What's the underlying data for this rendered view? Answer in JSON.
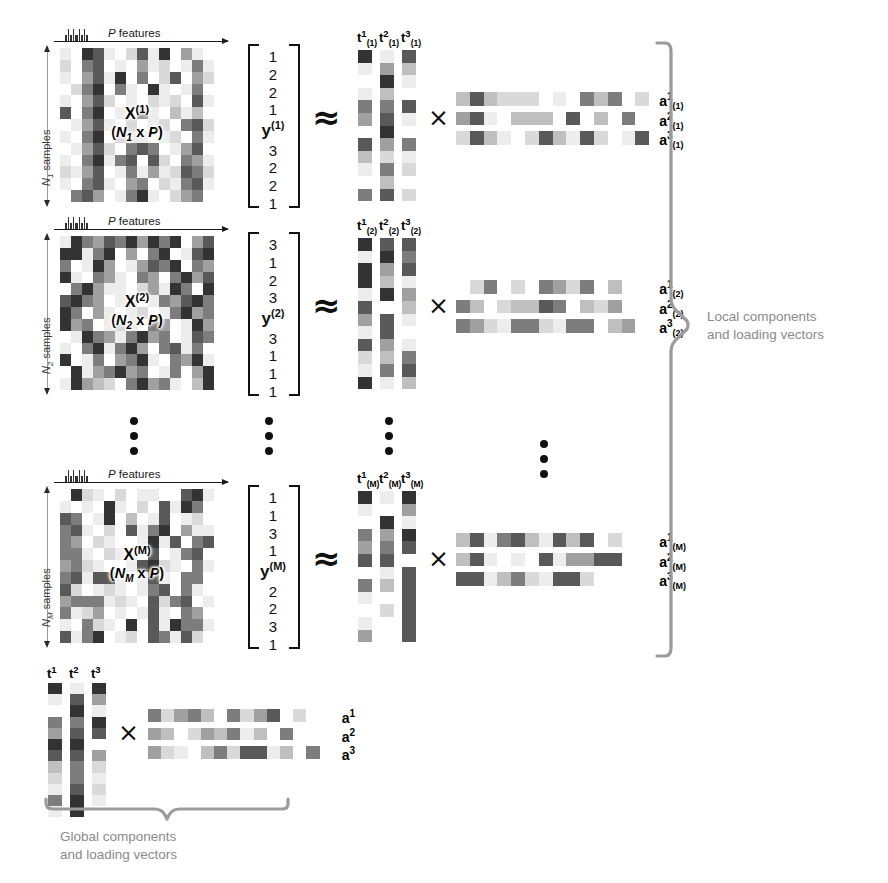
{
  "figure": {
    "palette": {
      "c0": "#ffffff",
      "c1": "#ededed",
      "c2": "#d9d9d9",
      "c3": "#bfbfbf",
      "c4": "#a0a0a0",
      "c5": "#7d7d7d",
      "c6": "#595959",
      "c7": "#333333",
      "brace": "#9b9b9b",
      "brace_text": "#8a8a8a",
      "ink": "#111111"
    },
    "symbols": {
      "approx": "≈",
      "times": "×",
      "ellipsis_dot_count": 3
    }
  },
  "blocks": [
    {
      "id": "block-1",
      "x_label_main": "X",
      "x_label_sup": "(1)",
      "x_dim_open": "(",
      "x_dim_n": "N",
      "x_dim_n_sub": "1",
      "x_dim_mid": " x ",
      "x_dim_p": "P",
      "x_dim_close": ")",
      "features_label": "P features",
      "samples_label_n": "N",
      "samples_label_sub": "1",
      "samples_label_rest": " samples",
      "y_label": "y",
      "y_label_sup": "(1)",
      "y_values_top": [
        "1",
        "2",
        "2",
        "1"
      ],
      "y_values_bottom": [
        "3",
        "2",
        "2",
        "1"
      ],
      "t_labels": [
        {
          "base": "t",
          "sup": "1",
          "sub": "(1)"
        },
        {
          "base": "t",
          "sup": "2",
          "sub": "(1)"
        },
        {
          "base": "t",
          "sup": "3",
          "sub": "(1)"
        }
      ],
      "a_labels": [
        {
          "base": "a",
          "sup": "1",
          "sub": "(1)"
        },
        {
          "base": "a",
          "sup": "2",
          "sub": "(1)"
        },
        {
          "base": "a",
          "sup": "3",
          "sub": "(1)"
        }
      ],
      "x_matrix": [
        [
          1,
          0,
          7,
          6,
          1,
          0,
          2,
          6,
          1,
          7,
          0,
          4,
          1,
          0
        ],
        [
          2,
          0,
          5,
          6,
          0,
          1,
          0,
          4,
          1,
          2,
          0,
          1,
          5,
          1
        ],
        [
          1,
          0,
          4,
          6,
          1,
          7,
          0,
          5,
          0,
          2,
          6,
          0,
          4,
          2
        ],
        [
          0,
          2,
          5,
          7,
          0,
          5,
          1,
          0,
          7,
          1,
          0,
          1,
          5,
          0
        ],
        [
          1,
          0,
          4,
          6,
          2,
          0,
          1,
          0,
          2,
          1,
          2,
          0,
          6,
          1
        ],
        [
          6,
          0,
          5,
          7,
          0,
          1,
          0,
          4,
          1,
          0,
          3,
          1,
          3,
          0
        ],
        [
          0,
          1,
          4,
          6,
          1,
          0,
          2,
          0,
          1,
          2,
          0,
          5,
          6,
          2
        ],
        [
          1,
          0,
          5,
          7,
          0,
          2,
          1,
          1,
          0,
          1,
          2,
          0,
          5,
          1
        ],
        [
          0,
          1,
          4,
          6,
          2,
          0,
          5,
          6,
          5,
          0,
          1,
          4,
          6,
          0
        ],
        [
          1,
          0,
          5,
          7,
          1,
          5,
          6,
          0,
          6,
          2,
          0,
          5,
          4,
          1
        ],
        [
          2,
          1,
          4,
          6,
          0,
          1,
          5,
          1,
          4,
          1,
          2,
          6,
          5,
          2
        ],
        [
          1,
          0,
          5,
          6,
          1,
          0,
          4,
          5,
          0,
          2,
          1,
          5,
          6,
          1
        ],
        [
          0,
          5,
          6,
          4,
          0,
          1,
          5,
          7,
          1,
          0,
          2,
          4,
          5,
          0
        ]
      ],
      "t_matrix": [
        [
          7,
          1,
          6
        ],
        [
          1,
          4,
          3
        ],
        [
          0,
          7,
          1
        ],
        [
          1,
          3,
          0
        ],
        [
          5,
          5,
          6
        ],
        [
          4,
          6,
          1
        ],
        [
          0,
          7,
          0
        ],
        [
          6,
          4,
          5
        ],
        [
          3,
          2,
          1
        ],
        [
          1,
          5,
          2
        ],
        [
          0,
          3,
          0
        ],
        [
          5,
          6,
          2
        ]
      ],
      "a_matrix": [
        [
          3,
          6,
          3,
          2,
          2,
          2,
          0,
          1,
          0,
          5,
          3,
          5,
          0,
          2
        ],
        [
          4,
          6,
          1,
          0,
          3,
          3,
          3,
          0,
          6,
          0,
          3,
          0,
          5,
          0
        ],
        [
          2,
          6,
          3,
          1,
          0,
          2,
          6,
          3,
          1,
          6,
          2,
          0,
          1,
          6
        ]
      ]
    },
    {
      "id": "block-2",
      "x_label_main": "X",
      "x_label_sup": "(2)",
      "x_dim_open": "(",
      "x_dim_n": "N",
      "x_dim_n_sub": "2",
      "x_dim_mid": " x ",
      "x_dim_p": "P",
      "x_dim_close": ")",
      "features_label": "P features",
      "samples_label_n": "N",
      "samples_label_sub": "2",
      "samples_label_rest": " samples",
      "y_label": "y",
      "y_label_sup": "(2)",
      "y_values_top": [
        "3",
        "1",
        "2",
        "3"
      ],
      "y_values_bottom": [
        "3",
        "1",
        "1",
        "1"
      ],
      "t_labels": [
        {
          "base": "t",
          "sup": "1",
          "sub": "(2)"
        },
        {
          "base": "t",
          "sup": "2",
          "sub": "(2)"
        },
        {
          "base": "t",
          "sup": "3",
          "sub": "(2)"
        }
      ],
      "a_labels": [
        {
          "base": "a",
          "sup": "1",
          "sub": "(2)"
        },
        {
          "base": "a",
          "sup": "2",
          "sub": "(2)"
        },
        {
          "base": "a",
          "sup": "3",
          "sub": "(2)"
        }
      ],
      "x_matrix": [
        [
          1,
          7,
          5,
          4,
          6,
          5,
          7,
          4,
          7,
          5,
          7,
          0,
          4,
          6
        ],
        [
          7,
          7,
          1,
          5,
          7,
          0,
          4,
          0,
          5,
          7,
          0,
          1,
          6,
          7
        ],
        [
          5,
          0,
          1,
          7,
          4,
          0,
          1,
          4,
          6,
          5,
          7,
          0,
          5,
          4
        ],
        [
          7,
          1,
          0,
          5,
          4,
          1,
          0,
          5,
          4,
          0,
          5,
          7,
          4,
          6
        ],
        [
          0,
          5,
          7,
          4,
          1,
          1,
          0,
          2,
          4,
          1,
          7,
          5,
          0,
          7
        ],
        [
          6,
          7,
          5,
          4,
          0,
          1,
          2,
          0,
          1,
          5,
          4,
          6,
          7,
          5
        ],
        [
          7,
          5,
          0,
          4,
          1,
          0,
          1,
          2,
          0,
          1,
          5,
          7,
          4,
          5
        ],
        [
          7,
          4,
          5,
          0,
          1,
          2,
          1,
          0,
          5,
          4,
          0,
          1,
          7,
          4
        ],
        [
          0,
          1,
          7,
          5,
          4,
          1,
          5,
          7,
          4,
          5,
          0,
          1,
          6,
          5
        ],
        [
          1,
          0,
          5,
          7,
          1,
          5,
          7,
          4,
          0,
          5,
          6,
          1,
          5,
          0
        ],
        [
          7,
          0,
          1,
          5,
          0,
          4,
          5,
          7,
          1,
          0,
          5,
          4,
          7,
          1
        ],
        [
          0,
          7,
          1,
          4,
          5,
          7,
          4,
          5,
          0,
          1,
          5,
          0,
          4,
          7
        ],
        [
          1,
          7,
          4,
          3,
          2,
          0,
          5,
          7,
          4,
          5,
          1,
          0,
          3,
          7
        ]
      ],
      "t_matrix": [
        [
          7,
          6,
          6
        ],
        [
          1,
          7,
          5
        ],
        [
          7,
          4,
          6
        ],
        [
          7,
          3,
          1
        ],
        [
          1,
          7,
          4
        ],
        [
          6,
          0,
          3
        ],
        [
          4,
          6,
          1
        ],
        [
          1,
          6,
          0
        ],
        [
          6,
          4,
          1
        ],
        [
          2,
          3,
          5
        ],
        [
          1,
          5,
          6
        ],
        [
          7,
          1,
          3
        ]
      ],
      "a_matrix": [
        [
          0,
          2,
          5,
          0,
          2,
          0,
          5,
          4,
          2,
          5,
          0,
          3,
          0,
          0
        ],
        [
          5,
          3,
          0,
          2,
          3,
          3,
          6,
          5,
          0,
          3,
          2,
          4,
          0,
          0
        ],
        [
          5,
          4,
          2,
          1,
          5,
          5,
          2,
          1,
          5,
          5,
          0,
          3,
          4,
          0
        ]
      ]
    },
    {
      "id": "block-m",
      "x_label_main": "X",
      "x_label_sup": "(M)",
      "x_dim_open": "(",
      "x_dim_n": "N",
      "x_dim_n_sub": "M",
      "x_dim_mid": " x ",
      "x_dim_p": "P",
      "x_dim_close": ")",
      "features_label": "P features",
      "samples_label_n": "N",
      "samples_label_sub": "M",
      "samples_label_rest": " samples",
      "y_label": "y",
      "y_label_sup": "(M)",
      "y_values_top": [
        "1",
        "1",
        "3",
        "1"
      ],
      "y_values_bottom": [
        "2",
        "2",
        "3",
        "1"
      ],
      "t_labels": [
        {
          "base": "t",
          "sup": "1",
          "sub": "(M)"
        },
        {
          "base": "t",
          "sup": "2",
          "sub": "(M)"
        },
        {
          "base": "t",
          "sup": "3",
          "sub": "(M)"
        }
      ],
      "a_labels": [
        {
          "base": "a",
          "sup": "1",
          "sub": "(M)"
        },
        {
          "base": "a",
          "sup": "2",
          "sub": "(M)"
        },
        {
          "base": "a",
          "sup": "3",
          "sub": "(M)"
        }
      ],
      "x_matrix": [
        [
          0,
          7,
          2,
          1,
          0,
          2,
          0,
          1,
          1,
          0,
          0,
          6,
          7,
          1
        ],
        [
          1,
          0,
          1,
          0,
          7,
          1,
          0,
          2,
          0,
          6,
          1,
          7,
          5,
          0
        ],
        [
          6,
          5,
          0,
          1,
          7,
          0,
          3,
          0,
          1,
          6,
          0,
          1,
          2,
          0
        ],
        [
          5,
          6,
          1,
          0,
          2,
          0,
          6,
          1,
          5,
          7,
          0,
          4,
          1,
          1
        ],
        [
          5,
          4,
          0,
          2,
          1,
          0,
          0,
          1,
          7,
          1,
          6,
          0,
          5,
          6
        ],
        [
          5,
          5,
          1,
          0,
          2,
          1,
          1,
          0,
          6,
          0,
          1,
          5,
          6,
          0
        ],
        [
          4,
          5,
          2,
          1,
          0,
          0,
          1,
          6,
          7,
          2,
          1,
          0,
          5,
          1
        ],
        [
          5,
          6,
          1,
          6,
          6,
          1,
          0,
          1,
          6,
          1,
          0,
          5,
          5,
          0
        ],
        [
          6,
          2,
          0,
          1,
          2,
          1,
          0,
          1,
          5,
          6,
          0,
          5,
          1,
          0
        ],
        [
          4,
          5,
          5,
          5,
          1,
          2,
          1,
          0,
          6,
          2,
          5,
          6,
          0,
          1
        ],
        [
          5,
          1,
          2,
          4,
          0,
          1,
          0,
          1,
          6,
          1,
          0,
          5,
          4,
          0
        ],
        [
          1,
          0,
          5,
          2,
          1,
          0,
          7,
          0,
          6,
          1,
          7,
          5,
          5,
          1
        ],
        [
          6,
          1,
          5,
          7,
          0,
          1,
          2,
          0,
          6,
          5,
          1,
          6,
          2,
          0
        ]
      ],
      "t_matrix": [
        [
          7,
          1,
          7
        ],
        [
          1,
          0,
          4
        ],
        [
          0,
          7,
          1
        ],
        [
          5,
          4,
          7
        ],
        [
          4,
          5,
          6
        ],
        [
          6,
          6,
          0
        ],
        [
          0,
          1,
          6
        ],
        [
          5,
          3,
          6
        ],
        [
          1,
          0,
          6
        ],
        [
          0,
          2,
          6
        ],
        [
          1,
          0,
          6
        ],
        [
          4,
          0,
          6
        ]
      ],
      "a_matrix": [
        [
          3,
          6,
          1,
          5,
          6,
          3,
          1,
          6,
          3,
          6,
          0,
          2,
          0,
          0
        ],
        [
          3,
          6,
          1,
          0,
          1,
          0,
          6,
          1,
          4,
          4,
          6,
          6,
          0,
          0
        ],
        [
          6,
          6,
          1,
          3,
          5,
          2,
          1,
          6,
          6,
          2,
          0,
          0,
          0,
          0
        ]
      ]
    }
  ],
  "global": {
    "t_labels": [
      {
        "base": "t",
        "sup": "1",
        "sub": ""
      },
      {
        "base": "t",
        "sup": "2",
        "sub": ""
      },
      {
        "base": "t",
        "sup": "3",
        "sub": ""
      }
    ],
    "a_labels": [
      {
        "base": "a",
        "sup": "1",
        "sub": ""
      },
      {
        "base": "a",
        "sup": "2",
        "sub": ""
      },
      {
        "base": "a",
        "sup": "3",
        "sub": ""
      }
    ],
    "t_matrix": [
      [
        7,
        1,
        7
      ],
      [
        1,
        6,
        4
      ],
      [
        0,
        7,
        1
      ],
      [
        5,
        5,
        7
      ],
      [
        4,
        6,
        6
      ],
      [
        7,
        7,
        0
      ],
      [
        6,
        6,
        4
      ],
      [
        3,
        5,
        2
      ],
      [
        2,
        5,
        1
      ],
      [
        1,
        6,
        2
      ],
      [
        5,
        7,
        1
      ],
      [
        1,
        7,
        0
      ]
    ],
    "a_matrix": [
      [
        5,
        2,
        4,
        5,
        3,
        0,
        5,
        2,
        4,
        6,
        0,
        2,
        0,
        0
      ],
      [
        4,
        3,
        0,
        2,
        4,
        3,
        5,
        1,
        3,
        0,
        5,
        0,
        0,
        0
      ],
      [
        4,
        2,
        1,
        0,
        3,
        5,
        2,
        6,
        6,
        1,
        3,
        0,
        5,
        0
      ]
    ],
    "brace_caption_line1": "Global components",
    "brace_caption_line2": "and loading vectors"
  },
  "local_brace": {
    "caption_line1": "Local components",
    "caption_line2": "and loading vectors"
  }
}
